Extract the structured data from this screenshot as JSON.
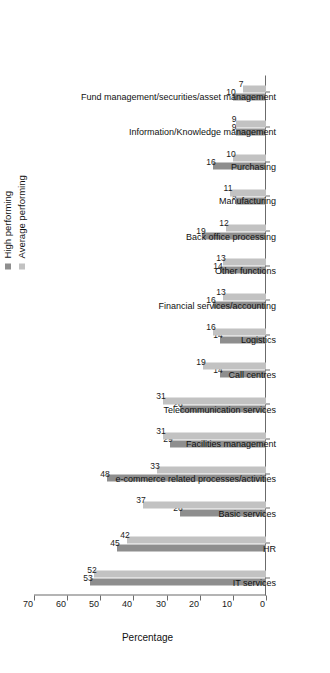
{
  "chart_data": {
    "type": "bar",
    "title": "",
    "xlabel": "",
    "ylabel": "Percentage",
    "ylim": [
      0,
      70
    ],
    "yticks": [
      0,
      10,
      20,
      30,
      40,
      50,
      60,
      70
    ],
    "grid": false,
    "orientation": "vertical-bars-on-rotated-page",
    "legend_position": "top-right",
    "categories": [
      "IT services",
      "HR",
      "Basic services",
      "e-commerce related processes/activities",
      "Facilities management",
      "Telecommunication services",
      "Call centres",
      "Logistics",
      "Financial services/accounting",
      "Other functions",
      "Back office processing",
      "Manufacturing",
      "Purchasing",
      "Information/Knowledge management",
      "Fund management/securities/asset management"
    ],
    "series": [
      {
        "name": "High performing",
        "color": "#8e8e8e",
        "values": [
          53,
          45,
          26,
          48,
          29,
          26,
          14,
          14,
          16,
          14,
          19,
          9,
          16,
          9,
          10
        ]
      },
      {
        "name": "Average performing",
        "color": "#c2c2c2",
        "values": [
          52,
          42,
          37,
          33,
          31,
          31,
          19,
          16,
          13,
          13,
          12,
          11,
          10,
          9,
          7
        ]
      }
    ]
  },
  "axis": {
    "value_axis_title": "Percentage",
    "tick_labels": [
      "0",
      "10",
      "20",
      "30",
      "40",
      "50",
      "60",
      "70"
    ]
  },
  "legend": {
    "items": [
      {
        "label": "High performing",
        "color": "#8e8e8e"
      },
      {
        "label": "Average performing",
        "color": "#c2c2c2"
      }
    ]
  }
}
